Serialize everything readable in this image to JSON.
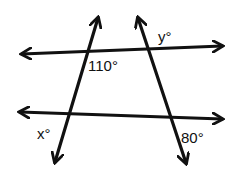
{
  "diagram": {
    "lines": [
      {
        "id": "top-line",
        "from": [
          20,
          54
        ],
        "to": [
          222,
          46
        ]
      },
      {
        "id": "bottom-line",
        "from": [
          18,
          112
        ],
        "to": [
          222,
          119
        ]
      },
      {
        "id": "left-transversal",
        "from": [
          98,
          16
        ],
        "to": [
          55,
          162
        ]
      },
      {
        "id": "right-transversal",
        "from": [
          138,
          16
        ],
        "to": [
          186,
          163
        ]
      }
    ],
    "labels": {
      "angle_110": "110°",
      "angle_y": "y°",
      "angle_x": "x°",
      "angle_80": "80°"
    },
    "stroke_color": "#111111"
  }
}
